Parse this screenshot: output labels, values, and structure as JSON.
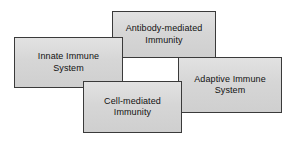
{
  "diagram": {
    "type": "overlapping-boxes-concept-diagram",
    "canvas": {
      "width": 291,
      "height": 141,
      "background": "#ffffff"
    },
    "style": {
      "box_fill": "#d6d6d6",
      "box_border": "#3a3a3a",
      "text_color": "#111111"
    },
    "nodes": [
      {
        "id": "adaptive-immune-system",
        "label": "Adaptive Immune\nSystem",
        "x": 178,
        "y": 57,
        "width": 104,
        "height": 56,
        "z": 1
      },
      {
        "id": "antibody-mediated-immunity",
        "label": "Antibody-mediated\nImmunity",
        "x": 112,
        "y": 11,
        "width": 104,
        "height": 47,
        "z": 2
      },
      {
        "id": "innate-immune-system",
        "label": "Innate Immune\nSystem",
        "x": 14,
        "y": 37,
        "width": 109,
        "height": 51,
        "z": 3
      },
      {
        "id": "cell-mediated-immunity",
        "label": "Cell-mediated\nImmunity",
        "x": 83,
        "y": 81,
        "width": 99,
        "height": 52,
        "z": 4
      }
    ]
  }
}
